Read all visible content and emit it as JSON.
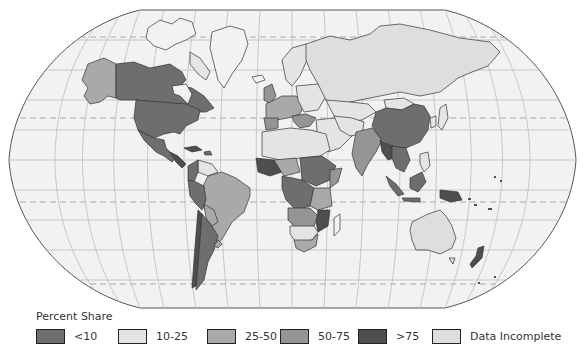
{
  "map": {
    "projection": "Robinson",
    "background_color": "#ffffff",
    "ocean_color": "#f2f2f2",
    "grid_color": "#bdbdbd",
    "border_color": "#333333"
  },
  "legend": {
    "title": "Percent Share",
    "items": [
      {
        "label": "<10",
        "color": "#6e6e6e"
      },
      {
        "label": "10-25",
        "color": "#e4e4e4"
      },
      {
        "label": "25-50",
        "color": "#a9a9a9"
      },
      {
        "label": "50-75",
        "color": "#959595"
      },
      {
        "label": ">75",
        "color": "#4e4e4e"
      },
      {
        "label": "Data Incomplete",
        "color": "#dedede"
      }
    ]
  }
}
